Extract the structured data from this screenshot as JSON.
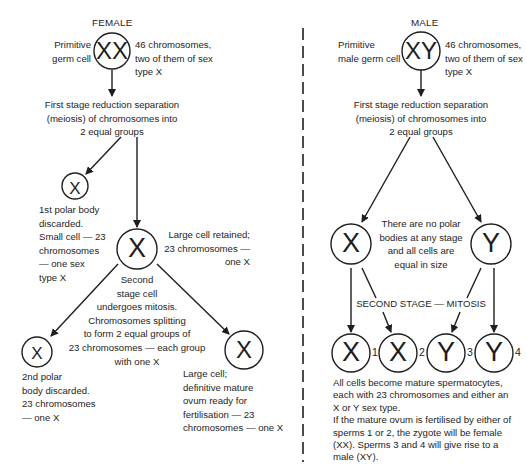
{
  "female": {
    "title": "FEMALE",
    "germ_cell_label": "Primitive\ngerm cell",
    "germ_cell_symbol": "XX",
    "germ_cell_note": "46 chromosomes,\ntwo of them of sex\ntype X",
    "first_stage": "First stage reduction separation\n(meiosis) of chromosomes into\n2 equal groups",
    "polar1_symbol": "X",
    "polar1_note": "1st polar body\ndiscarded.\nSmall cell — 23\nchromosomes\n— one sex\ntype X",
    "large_cell_symbol": "X",
    "large_cell_note": "Large cell retained;\n23 chromosomes —\none X",
    "second_stage": "Second\nstage cell\nundergoes mitosis.\nChromosomes splitting\nto form 2 equal groups of\n23 chromosomes — each group\nwith one X",
    "polar2_symbol": "X",
    "polar2_note": "2nd polar\nbody discarded.\n23 chromosomes\n— one X",
    "ovum_symbol": "X",
    "ovum_note": "Large cell;\ndefinitive mature\novum ready for\nfertilisation — 23\nchromosomes — one X"
  },
  "male": {
    "title": "MALE",
    "germ_cell_label": "Primitive\nmale germ cell",
    "germ_cell_symbol": "XY",
    "germ_cell_note": "46 chromosomes,\ntwo of them of sex\ntype X",
    "first_stage": "First stage reduction separation\n(meiosis) of chromosomes into\n2 equal groups",
    "cell_x_symbol": "X",
    "cell_y_symbol": "Y",
    "no_polar_note": "There are no polar\nbodies at any stage\nand all cells are\nequal in size",
    "second_stage": "SECOND STAGE — MITOSIS",
    "sperms": [
      {
        "symbol": "X",
        "number": "1"
      },
      {
        "symbol": "X",
        "number": "2"
      },
      {
        "symbol": "Y",
        "number": "3"
      },
      {
        "symbol": "Y",
        "number": "4"
      }
    ],
    "summary": "All cells become mature spermatocytes,\neach with 23 chromosomes and either an\nX or Y sex type.\nIf the mature ovum is fertilised by either of\nsperms 1 or 2, the zygote will be female\n(XX). Sperms 3 and 4 will give rise to a\nmale (XY)."
  },
  "colors": {
    "ink": "#1e1e1e",
    "background": "#ffffff"
  }
}
